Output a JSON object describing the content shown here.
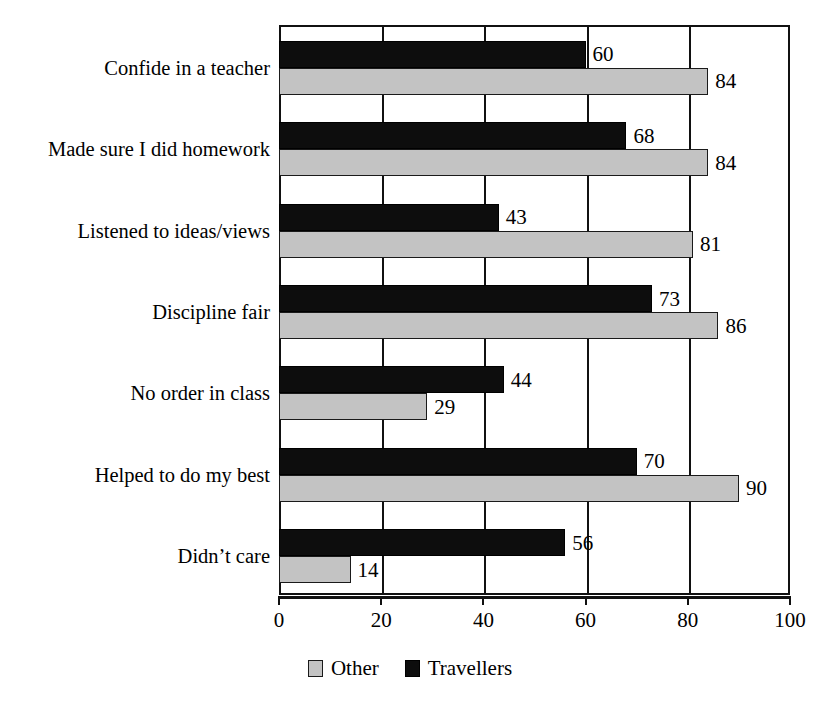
{
  "chart_data": {
    "type": "bar",
    "orientation": "horizontal",
    "title": "",
    "subtitle": "",
    "xlabel": "",
    "ylabel": "",
    "xlim": [
      0,
      100
    ],
    "xticks": [
      0,
      20,
      40,
      60,
      80,
      100
    ],
    "xtick_labels": [
      "0",
      "20",
      "40",
      "60",
      "80",
      "100"
    ],
    "grid": true,
    "grid_axis": "x",
    "legend_position": "bottom-center",
    "categories": [
      "Confide in a teacher",
      "Made sure I did homework",
      "Listened to ideas/views",
      "Discipline fair",
      "No order in class",
      "Helped to do my best",
      "Didn’t care"
    ],
    "series": [
      {
        "name": "Travellers",
        "color": "#0d0d0d",
        "values": [
          60,
          68,
          43,
          73,
          44,
          70,
          56
        ]
      },
      {
        "name": "Other",
        "color": "#c3c3c3",
        "values": [
          84,
          84,
          81,
          86,
          29,
          90,
          14
        ]
      }
    ],
    "data_labels": {
      "Travellers": [
        "60",
        "68",
        "43",
        "73",
        "44",
        "70",
        "56"
      ],
      "Other": [
        "84",
        "84",
        "81",
        "86",
        "29",
        "90",
        "14"
      ]
    }
  },
  "legend": {
    "items": [
      {
        "label": "Other",
        "swatch": "other"
      },
      {
        "label": "Travellers",
        "swatch": "travellers"
      }
    ]
  }
}
